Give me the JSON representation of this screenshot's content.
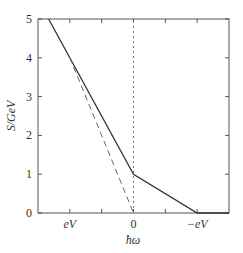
{
  "chart_data": {
    "type": "line",
    "title": "",
    "xlabel": "ħω",
    "ylabel": "S/GeV",
    "xlim": [
      -1.5,
      1.5
    ],
    "ylim": [
      0,
      5
    ],
    "x_ticks": [
      {
        "value": -1,
        "label": "eV"
      },
      {
        "value": -0.5,
        "label": ""
      },
      {
        "value": 0,
        "label": "0"
      },
      {
        "value": 0.5,
        "label": ""
      },
      {
        "value": 1,
        "label": "−eV"
      }
    ],
    "y_ticks": [
      {
        "value": 0,
        "label": "0"
      },
      {
        "value": 1,
        "label": "1"
      },
      {
        "value": 2,
        "label": "2"
      },
      {
        "value": 3,
        "label": "3"
      },
      {
        "value": 4,
        "label": "4"
      },
      {
        "value": 5,
        "label": "5"
      }
    ],
    "grid": false,
    "series": [
      {
        "name": "solid",
        "style": "solid",
        "x": [
          -1.333,
          -1,
          0,
          1,
          1.5
        ],
        "y": [
          5,
          4,
          1,
          0,
          0
        ]
      },
      {
        "name": "dashed",
        "style": "dashed",
        "x": [
          -1,
          0
        ],
        "y": [
          4,
          0
        ]
      },
      {
        "name": "dotted",
        "style": "dotted",
        "x": [
          0,
          0
        ],
        "y": [
          0,
          5
        ]
      }
    ]
  },
  "colors": {
    "line": "#333333",
    "dashed": "#666666",
    "dotted": "#777777",
    "frame": "#555555"
  }
}
